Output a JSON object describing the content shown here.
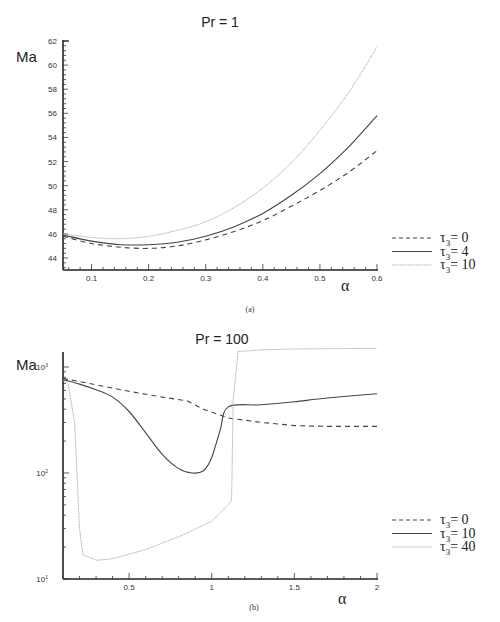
{
  "chart_data": [
    {
      "type": "line",
      "panel": "(a)",
      "title": "Pr = 1",
      "xlabel": "α",
      "ylabel": "Ma",
      "xlim": [
        0.05,
        0.6
      ],
      "ylim": [
        43,
        62
      ],
      "yscale": "linear",
      "xticks": [
        "0.1",
        "0.2",
        "0.3",
        "0.4",
        "0.5",
        "0.6"
      ],
      "yticks": [
        "44",
        "46",
        "48",
        "50",
        "52",
        "54",
        "56",
        "58",
        "60",
        "62"
      ],
      "grid": false,
      "legend_position": "right",
      "x": [
        0.05,
        0.1,
        0.15,
        0.2,
        0.25,
        0.3,
        0.35,
        0.4,
        0.45,
        0.5,
        0.55,
        0.6
      ],
      "series": [
        {
          "name": "τ3= 0",
          "style": "dashed",
          "color": "#444444",
          "values": [
            45.8,
            45.2,
            44.9,
            44.8,
            45.0,
            45.5,
            46.2,
            47.1,
            48.3,
            49.6,
            51.1,
            52.9
          ]
        },
        {
          "name": "τ3= 4",
          "style": "solid",
          "color": "#444444",
          "values": [
            45.9,
            45.4,
            45.1,
            45.1,
            45.3,
            45.8,
            46.6,
            47.7,
            49.2,
            51.0,
            53.2,
            55.8
          ]
        },
        {
          "name": "τ3= 10",
          "style": "dotted",
          "color": "#aaaaaa",
          "values": [
            46.0,
            45.7,
            45.6,
            45.8,
            46.3,
            47.0,
            48.2,
            49.8,
            51.9,
            54.6,
            57.7,
            61.5
          ]
        }
      ]
    },
    {
      "type": "line",
      "panel": "(b)",
      "title": "Pr = 100",
      "xlabel": "α",
      "ylabel": "Ma",
      "xlim": [
        0.1,
        2
      ],
      "ylim": [
        10,
        1500
      ],
      "yscale": "log",
      "xticks": [
        "0.5",
        "1",
        "1.5",
        "2"
      ],
      "yticks": [
        "10¹",
        "10²",
        "10³"
      ],
      "grid": false,
      "legend_position": "right",
      "series": [
        {
          "name": "τ3= 0",
          "style": "dashed",
          "color": "#444444",
          "x": [
            0.1,
            0.3,
            0.5,
            0.7,
            0.85,
            0.95,
            1.1,
            1.3,
            1.5,
            1.7,
            2.0
          ],
          "values": [
            780,
            680,
            590,
            520,
            480,
            400,
            330,
            300,
            280,
            275,
            275
          ]
        },
        {
          "name": "τ3= 10",
          "style": "solid",
          "color": "#444444",
          "x": [
            0.1,
            0.2,
            0.3,
            0.4,
            0.5,
            0.6,
            0.7,
            0.8,
            0.88,
            0.95,
            1.0,
            1.05,
            1.1,
            1.3,
            1.5,
            1.7,
            2.0
          ],
          "values": [
            760,
            690,
            610,
            520,
            380,
            240,
            150,
            110,
            100,
            105,
            140,
            250,
            420,
            440,
            470,
            510,
            560
          ]
        },
        {
          "name": "τ3= 40",
          "style": "dotted",
          "color": "#aaaaaa",
          "x": [
            0.1,
            0.13,
            0.17,
            0.2,
            0.22,
            0.3,
            0.4,
            0.6,
            0.8,
            1.0,
            1.1,
            1.12,
            1.13,
            1.16,
            1.3,
            1.5,
            2.0
          ],
          "values": [
            750,
            700,
            300,
            30,
            17,
            15,
            15.5,
            19,
            25,
            35,
            50,
            55,
            500,
            1400,
            1450,
            1480,
            1500
          ]
        }
      ]
    }
  ],
  "charts": [
    {
      "title": "Pr = 1",
      "ylabel": "Ma",
      "xlabel": "α",
      "caption": "(a)",
      "legend": [
        {
          "sym": "τ",
          "sub": "3",
          "text": "= 0"
        },
        {
          "sym": "τ",
          "sub": "3",
          "text": "= 4"
        },
        {
          "sym": "τ",
          "sub": "3",
          "text": "= 10"
        }
      ]
    },
    {
      "title": "Pr = 100",
      "ylabel": "Ma",
      "xlabel": "α",
      "caption": "(b)",
      "legend": [
        {
          "sym": "τ",
          "sub": "3",
          "text": "= 0"
        },
        {
          "sym": "τ",
          "sub": "3",
          "text": "= 10"
        },
        {
          "sym": "τ",
          "sub": "3",
          "text": "= 40"
        }
      ]
    }
  ]
}
